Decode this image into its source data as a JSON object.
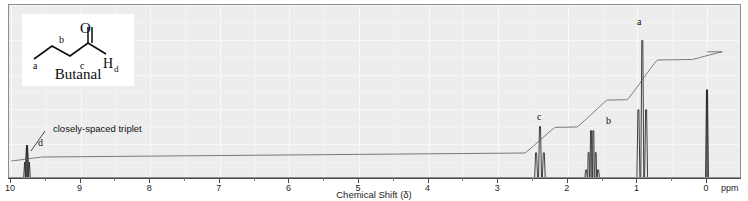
{
  "chart_data": {
    "type": "line",
    "title": "",
    "xlabel": "Chemical Shift (δ)",
    "ylabel": "",
    "xlim": [
      10,
      0
    ],
    "grid": true,
    "legend_position": "none",
    "x_ticks": [
      10,
      9,
      8,
      7,
      6,
      5,
      4,
      3,
      2,
      1,
      0
    ],
    "x_tick_labels": [
      "10",
      "9",
      "8",
      "7",
      "6",
      "5",
      "4",
      "3",
      "2",
      "1",
      "0"
    ],
    "x_unit": "ppm",
    "series": [
      {
        "name": "1H NMR trace",
        "peaks": [
          {
            "id": "d",
            "label": "d",
            "shift_ppm": 9.77,
            "rel_height": 0.22,
            "multiplicity": "triplet",
            "assignment": "aldehyde CHO",
            "protons": 1
          },
          {
            "id": "c",
            "label": "c",
            "shift_ppm": 2.4,
            "rel_height": 0.34,
            "multiplicity": "triplet",
            "assignment": "CH2 alpha to C=O",
            "protons": 2
          },
          {
            "id": "b",
            "label": "b",
            "shift_ppm": 1.65,
            "rel_height": 0.33,
            "multiplicity": "sextet",
            "assignment": "CH2",
            "protons": 2
          },
          {
            "id": "a",
            "label": "a",
            "shift_ppm": 0.93,
            "rel_height": 0.9,
            "multiplicity": "triplet",
            "assignment": "CH3",
            "protons": 3
          },
          {
            "id": "tms",
            "label": "",
            "shift_ppm": 0.0,
            "rel_height": 0.58,
            "multiplicity": "singlet",
            "assignment": "TMS reference",
            "protons": 0
          }
        ]
      },
      {
        "name": "integration trace",
        "steps": [
          {
            "shift_ppm": 9.77,
            "rise": 0.03
          },
          {
            "shift_ppm": 2.4,
            "rise": 0.2
          },
          {
            "shift_ppm": 1.65,
            "rise": 0.21
          },
          {
            "shift_ppm": 0.93,
            "rise": 0.31
          },
          {
            "shift_ppm": 0.0,
            "rise": 0.06
          }
        ]
      }
    ],
    "annotations": [
      {
        "text": "closely-spaced triplet",
        "points_to_ppm": 9.77
      }
    ]
  },
  "axis": {
    "title": "Chemical Shift (δ)",
    "unit_label": "ppm",
    "ticks": [
      "10",
      "9",
      "8",
      "7",
      "6",
      "5",
      "4",
      "3",
      "2",
      "1",
      "0"
    ]
  },
  "structure": {
    "compound_name": "Butanal",
    "atom_labels": {
      "a": "a",
      "b": "b",
      "c": "c",
      "oxygen": "O",
      "hydrogen": "H",
      "hydrogen_sub": "d"
    }
  },
  "peak_labels": {
    "a": "a",
    "b": "b",
    "c": "c",
    "d": "d"
  },
  "annotation": {
    "closely_spaced_triplet": "closely-spaced triplet"
  },
  "colors": {
    "plot_background": "#ededed",
    "gridline": "#fafafa",
    "trace": "#2a2a2a",
    "axis": "#4a4a4a",
    "inset_background": "#ffffff",
    "text": "#101010"
  }
}
